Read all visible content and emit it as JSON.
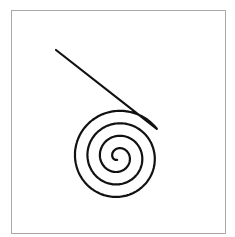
{
  "diagram": {
    "title": "",
    "frame": {
      "x": 11,
      "y": 10,
      "width": 215,
      "height": 224,
      "border_color": "#a8a8a8"
    },
    "spiral": {
      "center": [
        118,
        157
      ],
      "turns": 3.6,
      "spacing": 12.5,
      "start_radius": 3,
      "stroke_color": "#111111",
      "stroke_width": 2.2,
      "direction": "clockwise-outward"
    },
    "tail_line": {
      "start": [
        56,
        50
      ]
    }
  }
}
